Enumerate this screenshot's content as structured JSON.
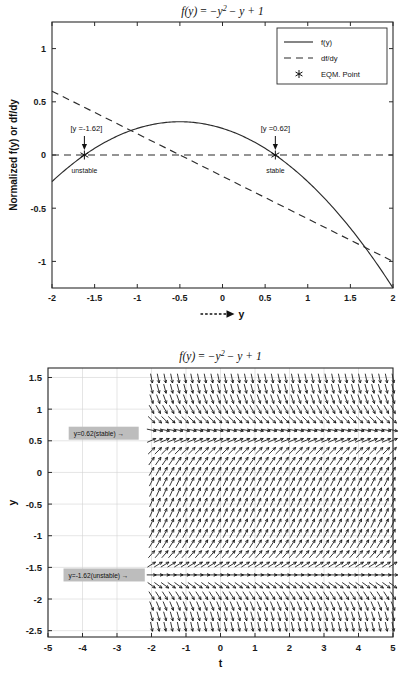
{
  "page": {
    "width": 409,
    "height": 690,
    "background": "#ffffff"
  },
  "chart_data": [
    {
      "id": "phase-line-plot",
      "type": "line",
      "title": "f(y) = -y^2 - y + 1",
      "title_parts": {
        "lhs": "f(y)",
        "eq": "=",
        "rhs_a": "−y",
        "sup": "2",
        "rhs_b": "− y + 1"
      },
      "xlabel": "------> y",
      "xlabel_text": "y",
      "ylabel": "Normalized  f(y) or df/dy",
      "xlim": [
        -2,
        2
      ],
      "ylim": [
        -1.25,
        1.25
      ],
      "xticks": [
        -2,
        -1.5,
        -1,
        -0.5,
        0,
        0.5,
        1,
        1.5,
        2
      ],
      "xticklabels": [
        "-2",
        "-1.5",
        "-1",
        "-0.5",
        "0",
        "0.5",
        "1",
        "1.5",
        "2"
      ],
      "yticks": [
        1,
        0.5,
        0,
        -0.5,
        -1
      ],
      "yticklabels": [
        "1",
        "0.5",
        "0",
        "-0.5",
        "-1"
      ],
      "grid": false,
      "legend_position": "upper right",
      "legend": [
        {
          "label": "f(y)",
          "style": "solid"
        },
        {
          "label": "df/dy",
          "style": "dashed"
        },
        {
          "label": "EQM. Point",
          "style": "marker-asterisk"
        }
      ],
      "series": [
        {
          "name": "f(y)",
          "style": "solid",
          "formula": "(-y*y - y + 1)/4",
          "x": [
            -2,
            -1.8,
            -1.6,
            -1.4,
            -1.2,
            -1,
            -0.8,
            -0.6,
            -0.4,
            -0.2,
            0,
            0.2,
            0.4,
            0.6,
            0.8,
            1,
            1.2,
            1.4,
            1.6,
            1.8,
            2
          ],
          "y": [
            -0.25,
            -0.155,
            -0.09,
            -0.04,
            -0.005,
            0.0,
            0.01,
            0.0,
            -0.04,
            -0.09,
            -0.155,
            -0.25,
            -0.36,
            -0.49,
            -0.64,
            -0.81,
            -1.0,
            -1.21,
            -1.44,
            -1.69,
            -1.96
          ]
        },
        {
          "name": "df/dy",
          "style": "dashed",
          "formula": "(-2*y - 1)/5",
          "x": [
            -2,
            2
          ],
          "y": [
            0.6,
            -1.0
          ]
        },
        {
          "name": "zero-reference",
          "style": "dashed",
          "x": [
            -2,
            2
          ],
          "y": [
            0,
            0
          ]
        }
      ],
      "equilibrium_points": [
        {
          "y": -1.62,
          "label": "[y =-1.62]",
          "stability": "unstable"
        },
        {
          "y": 0.62,
          "label": "[y =0.62]",
          "stability": "stable"
        }
      ]
    },
    {
      "id": "direction-field-plot",
      "type": "quiver",
      "title": "f(y) = -y^2 - y + 1",
      "title_parts": {
        "lhs": "f(y)",
        "eq": "=",
        "rhs_a": "−y",
        "sup": "2",
        "rhs_b": "− y + 1"
      },
      "xlabel": "t",
      "ylabel": "y",
      "xlim": [
        -5,
        5
      ],
      "ylim": [
        -2.6,
        1.65
      ],
      "xticks": [
        -5,
        -4,
        -3,
        -2,
        -1,
        0,
        1,
        2,
        3,
        4,
        5
      ],
      "xticklabels": [
        "-5",
        "-4",
        "-3",
        "-2",
        "-1",
        "0",
        "1",
        "2",
        "3",
        "4",
        "5"
      ],
      "yticks": [
        1.5,
        1,
        0.5,
        0,
        -0.5,
        -1,
        -1.5,
        -2,
        -2.5
      ],
      "yticklabels": [
        "1.5",
        "1",
        "0.5",
        "0",
        "-0.5",
        "-1",
        "-1.5",
        "-2",
        "-2.5"
      ],
      "grid": true,
      "field_t_start": -2,
      "field_t_end": 5,
      "field_formula": "dy/dt = -y^2 - y + 1",
      "annotations": [
        {
          "text": "y=0.62(stable) →",
          "y": 0.62,
          "t": -4.4,
          "background": "#bdbdbd"
        },
        {
          "text": "y=-1.62(unstable) →",
          "y": -1.62,
          "t": -4.55,
          "background": "#bdbdbd"
        }
      ],
      "equilibria": [
        0.62,
        -1.62
      ]
    }
  ],
  "colors": {
    "axis": "#2a2a2a",
    "curve": "#2b2b2b",
    "grid": "#d4d4d4",
    "annotation_bg": "#bdbdbd",
    "text": "#111111"
  }
}
